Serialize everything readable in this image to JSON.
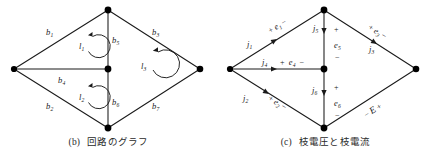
{
  "figure": {
    "panels": [
      {
        "tag": "(b)",
        "caption": "回路のグラフ",
        "type": "circuit-graph",
        "branches": [
          {
            "id": "b1",
            "label": "b",
            "sub": "1",
            "edge": "upper-left"
          },
          {
            "id": "b2",
            "label": "b",
            "sub": "2",
            "edge": "lower-left"
          },
          {
            "id": "b3",
            "label": "b",
            "sub": "3",
            "edge": "upper-right"
          },
          {
            "id": "b4",
            "label": "b",
            "sub": "4",
            "edge": "middle-horizontal"
          },
          {
            "id": "b5",
            "label": "b",
            "sub": "5",
            "edge": "upper-vertical"
          },
          {
            "id": "b6",
            "label": "b",
            "sub": "6",
            "edge": "lower-vertical"
          },
          {
            "id": "b7",
            "label": "b",
            "sub": "7",
            "edge": "lower-right"
          }
        ],
        "loops": [
          {
            "id": "l1",
            "label": "l",
            "sub": "1",
            "direction": "clockwise"
          },
          {
            "id": "l2",
            "label": "l",
            "sub": "2",
            "direction": "clockwise"
          },
          {
            "id": "l3",
            "label": "l",
            "sub": "3",
            "direction": "clockwise"
          }
        ]
      },
      {
        "tag": "(c)",
        "caption": "枝電圧と枝電流",
        "type": "branch-voltage-current",
        "currents": [
          {
            "id": "j1",
            "label": "j",
            "sub": "1",
            "edge": "upper-left"
          },
          {
            "id": "j2",
            "label": "j",
            "sub": "2",
            "edge": "lower-left"
          },
          {
            "id": "j3",
            "label": "j",
            "sub": "3",
            "edge": "upper-right"
          },
          {
            "id": "j4",
            "label": "j",
            "sub": "4",
            "edge": "middle-horizontal"
          },
          {
            "id": "j5",
            "label": "j",
            "sub": "5",
            "edge": "upper-vertical"
          },
          {
            "id": "j6",
            "label": "j",
            "sub": "6",
            "edge": "lower-vertical"
          }
        ],
        "voltages": [
          {
            "id": "e1",
            "label": "e",
            "sub": "1",
            "plus": "+",
            "minus": "−",
            "edge": "upper-left"
          },
          {
            "id": "e2",
            "label": "e",
            "sub": "2",
            "plus": "+",
            "minus": "−",
            "edge": "lower-left"
          },
          {
            "id": "e3",
            "label": "e",
            "sub": "3",
            "plus": "+",
            "minus": "−",
            "edge": "upper-right"
          },
          {
            "id": "e4",
            "label": "e",
            "sub": "4",
            "plus": "+",
            "minus": "−",
            "edge": "middle-horizontal"
          },
          {
            "id": "e5",
            "label": "e",
            "sub": "5",
            "plus": "+",
            "minus": "−",
            "edge": "upper-vertical"
          },
          {
            "id": "e6",
            "label": "e",
            "sub": "6",
            "plus": "+",
            "minus": "−",
            "edge": "lower-vertical"
          }
        ],
        "source": {
          "id": "E",
          "label": "E",
          "plus": "+",
          "minus": "−",
          "edge": "lower-right"
        }
      }
    ],
    "colors": {
      "line": "#1a1a1a",
      "node": "#000000",
      "text": "#1a1a1a",
      "caption": "#2a2a2a",
      "background": "#ffffff"
    }
  }
}
